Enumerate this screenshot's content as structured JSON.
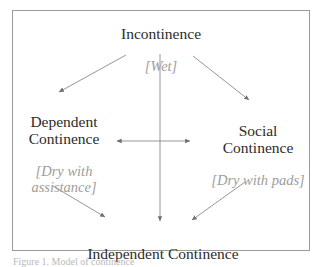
{
  "figure": {
    "type": "flow-diagram",
    "frame_border_color": "#9a9a9a",
    "background_color": "#ffffff",
    "main_text_color": "#2b2b2b",
    "sub_text_color": "#9d9d9d",
    "arrow_color": "#8a8a8a",
    "caption": "Figure 1.  Model of continence"
  },
  "nodes": {
    "incontinence": {
      "label": "Incontinence",
      "sublabel": "[Wet]"
    },
    "dependent_continence": {
      "label": "Dependent\nContinence",
      "sublabel": "[Dry with\nassistance]"
    },
    "social_continence": {
      "label": "Social\nContinence",
      "sublabel": "[Dry with pads]"
    },
    "independent_continence": {
      "label": "Independent Continence",
      "sublabel": ""
    }
  },
  "edges": [
    {
      "name": "incontinence-to-dependent",
      "from": "incontinence",
      "to": "dependent_continence",
      "style": "single-arrow"
    },
    {
      "name": "incontinence-to-social",
      "from": "incontinence",
      "to": "social_continence",
      "style": "single-arrow"
    },
    {
      "name": "incontinence-to-independent",
      "from": "incontinence",
      "to": "independent_continence",
      "style": "single-arrow"
    },
    {
      "name": "dependent-to-social",
      "from": "dependent_continence",
      "to": "social_continence",
      "style": "double-arrow"
    },
    {
      "name": "dependent-to-independent",
      "from": "dependent_continence",
      "to": "independent_continence",
      "style": "single-arrow"
    },
    {
      "name": "social-to-independent",
      "from": "social_continence",
      "to": "independent_continence",
      "style": "single-arrow"
    }
  ]
}
